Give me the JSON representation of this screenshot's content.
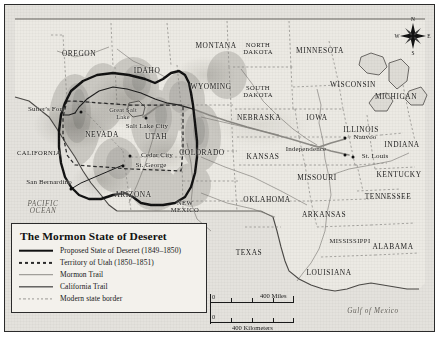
{
  "legend": {
    "title": "The Mormon State of Deseret",
    "entries": [
      {
        "label": "Proposed State of Deseret (1849–1850)",
        "style": "thick-solid-black",
        "color": "#111111"
      },
      {
        "label": "Territory of Utah (1850–1851)",
        "style": "dashed-black",
        "color": "#2a2a2a"
      },
      {
        "label": "Mormon Trail",
        "style": "solid-gray",
        "color": "#8d8b86"
      },
      {
        "label": "California Trail",
        "style": "thin-solid-black",
        "color": "#1c1c1c"
      },
      {
        "label": "Modern state border",
        "style": "dotted-gray",
        "color": "#9a9894"
      }
    ]
  },
  "scale": {
    "miles": {
      "zero": "0",
      "label": "400 Miles"
    },
    "kilometers": {
      "zero": "0",
      "label": "400 Kilometers"
    }
  },
  "compass": {
    "north": "N",
    "south": "S",
    "east": "E",
    "west": "W"
  },
  "water_labels": [
    {
      "name": "pacific-ocean",
      "text": "PACIFIC\nOCEAN",
      "x": 38,
      "y": 203,
      "size": "normal"
    },
    {
      "name": "gulf-of-mexico",
      "text": "Gulf of Mexico",
      "x": 368,
      "y": 307,
      "size": "normal"
    },
    {
      "name": "great-salt-lake",
      "text": "Great Salt\nLake",
      "x": 118,
      "y": 109,
      "size": "lake"
    }
  ],
  "states": [
    {
      "name": "oregon",
      "text": "OREGON",
      "x": 74,
      "y": 49
    },
    {
      "name": "idaho",
      "text": "IDAHO",
      "x": 142,
      "y": 66
    },
    {
      "name": "montana",
      "text": "MONTANA",
      "x": 211,
      "y": 41
    },
    {
      "name": "wyoming",
      "text": "WYOMING",
      "x": 206,
      "y": 82
    },
    {
      "name": "north-dakota",
      "text": "NORTH\nDAKOTA",
      "x": 253,
      "y": 44
    },
    {
      "name": "south-dakota",
      "text": "SOUTH\nDAKOTA",
      "x": 253,
      "y": 87
    },
    {
      "name": "minnesota",
      "text": "MINNESOTA",
      "x": 315,
      "y": 46
    },
    {
      "name": "wisconsin",
      "text": "WISCONSIN",
      "x": 348,
      "y": 80
    },
    {
      "name": "michigan",
      "text": "MICHIGAN",
      "x": 391,
      "y": 92
    },
    {
      "name": "nebraska",
      "text": "NEBRASKA",
      "x": 254,
      "y": 113
    },
    {
      "name": "iowa",
      "text": "IOWA",
      "x": 312,
      "y": 113
    },
    {
      "name": "illinois",
      "text": "ILLINOIS",
      "x": 356,
      "y": 125
    },
    {
      "name": "indiana",
      "text": "INDIANA",
      "x": 397,
      "y": 140
    },
    {
      "name": "nevada",
      "text": "NEVADA",
      "x": 97,
      "y": 130
    },
    {
      "name": "utah",
      "text": "UTAH",
      "x": 151,
      "y": 132
    },
    {
      "name": "colorado",
      "text": "COLORADO",
      "x": 197,
      "y": 148
    },
    {
      "name": "kansas",
      "text": "KANSAS",
      "x": 258,
      "y": 152
    },
    {
      "name": "missouri",
      "text": "MISSOURI",
      "x": 312,
      "y": 173
    },
    {
      "name": "kentucky",
      "text": "KENTUCKY",
      "x": 394,
      "y": 170
    },
    {
      "name": "california",
      "text": "CALIFORNIA",
      "x": 34,
      "y": 148
    },
    {
      "name": "arizona",
      "text": "ARIZONA",
      "x": 128,
      "y": 190
    },
    {
      "name": "new-mexico",
      "text": "NEW\nMEXICO",
      "x": 180,
      "y": 202
    },
    {
      "name": "oklahoma",
      "text": "OKLAHOMA",
      "x": 262,
      "y": 195
    },
    {
      "name": "arkansas",
      "text": "ARKANSAS",
      "x": 319,
      "y": 210
    },
    {
      "name": "tennessee",
      "text": "TENNESSEE",
      "x": 383,
      "y": 192
    },
    {
      "name": "mississippi",
      "text": "MISSISSIPPI",
      "x": 345,
      "y": 236
    },
    {
      "name": "alabama",
      "text": "ALABAMA",
      "x": 388,
      "y": 242
    },
    {
      "name": "texas",
      "text": "TEXAS",
      "x": 244,
      "y": 248
    },
    {
      "name": "louisiana",
      "text": "LOUISIANA",
      "x": 324,
      "y": 268
    }
  ],
  "cities": [
    {
      "name": "sutters-fort",
      "text": "Sutter's Fort",
      "tx": 41,
      "ty": 105,
      "dx": 76,
      "dy": 107
    },
    {
      "name": "salt-lake-city",
      "text": "Salt Lake City",
      "tx": 142,
      "ty": 122,
      "dx": 141,
      "dy": 113
    },
    {
      "name": "cedar-city",
      "text": "Cedar City",
      "tx": 152,
      "ty": 151,
      "dx": 125,
      "dy": 151
    },
    {
      "name": "st-george",
      "text": "St. George",
      "tx": 146,
      "ty": 161,
      "dx": 118,
      "dy": 161
    },
    {
      "name": "san-bernardino",
      "text": "San Bernardino",
      "tx": 44,
      "ty": 178,
      "dx": 66,
      "dy": 184
    },
    {
      "name": "nauvoo",
      "text": "Nauvoo",
      "tx": 360,
      "ty": 133,
      "dx": 340,
      "dy": 133
    },
    {
      "name": "independence",
      "text": "Independence",
      "tx": 301,
      "ty": 145,
      "dx": 340,
      "dy": 150
    },
    {
      "name": "st-louis",
      "text": "St. Louis",
      "tx": 370,
      "ty": 152,
      "dx": 348,
      "dy": 152
    }
  ]
}
